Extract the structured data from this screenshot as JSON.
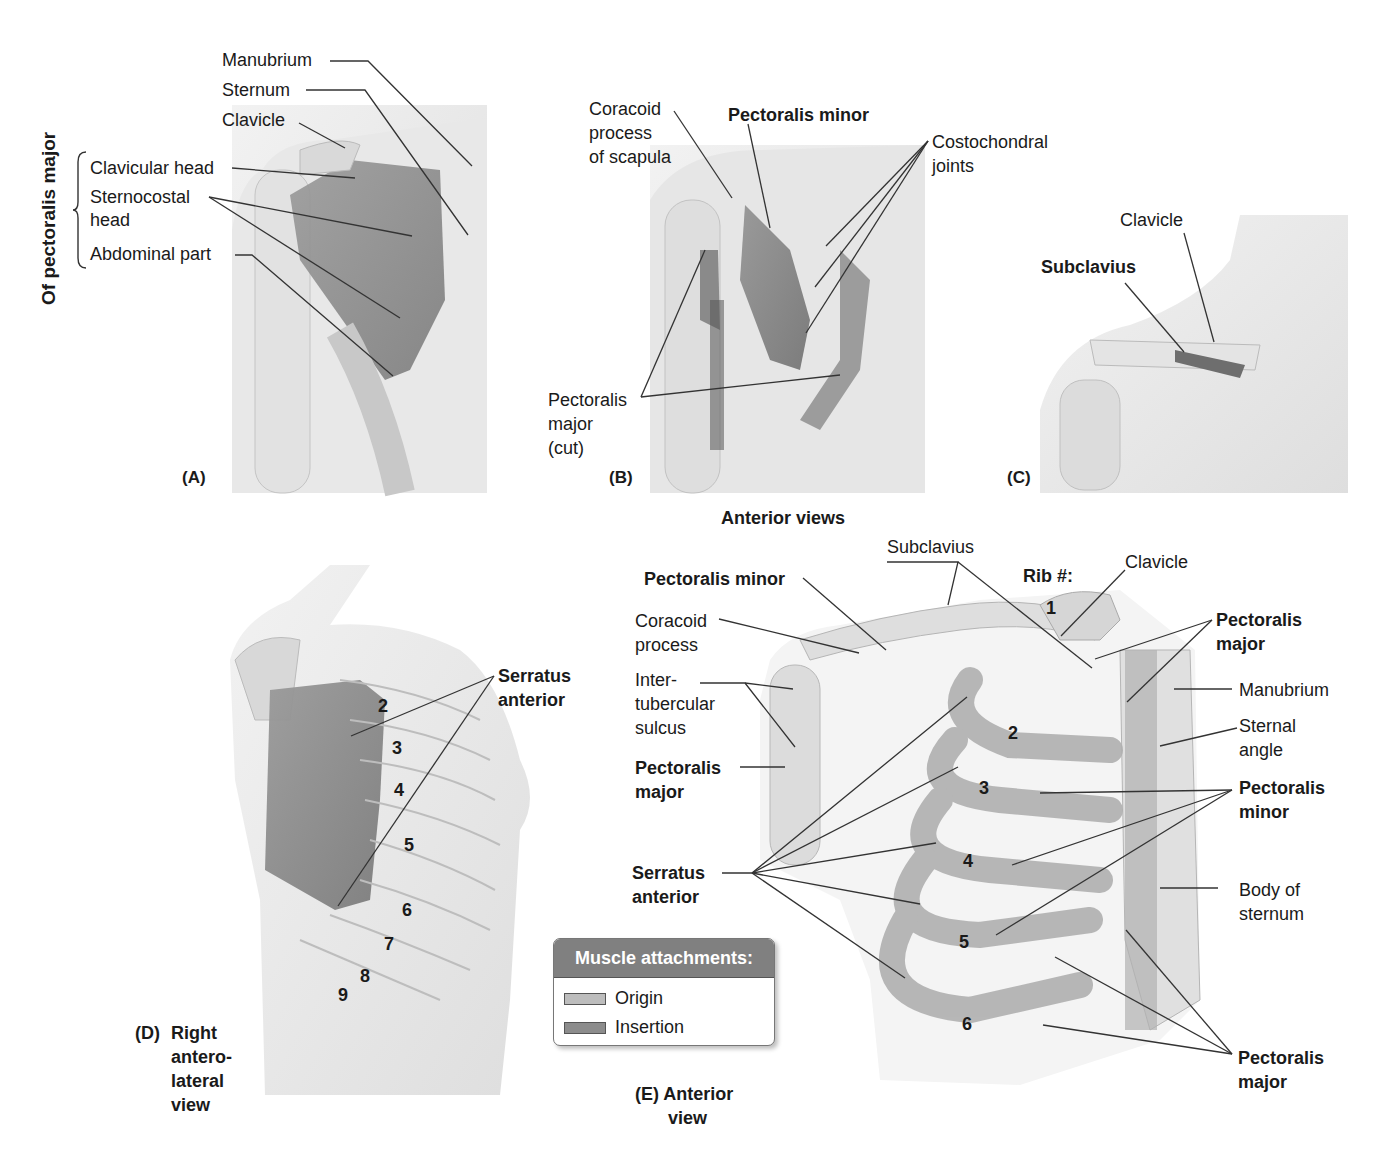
{
  "figure": {
    "side_title": "Of pectoralis major",
    "group_title": "Anterior views",
    "colors": {
      "skin": "#ececec",
      "bone": "#dcdcdc",
      "muscle": "#8a8a8a",
      "origin_swatch": "#bdbdbd",
      "insertion_swatch": "#8c8c8c",
      "legend_header": "#808080",
      "line": "#333333"
    }
  },
  "panels": {
    "A": {
      "tag": "(A)",
      "labels": [
        "Manubrium",
        "Sternum",
        "Clavicle",
        "Clavicular head",
        "Sternocostal",
        "head",
        "Abdominal part"
      ]
    },
    "B": {
      "tag": "(B)",
      "labels": {
        "coracoid": [
          "Coracoid",
          "process",
          "of scapula"
        ],
        "pec_minor": "Pectoralis minor",
        "costochondral": [
          "Costochondral",
          "joints"
        ],
        "pec_major_cut": [
          "Pectoralis",
          "major",
          "(cut)"
        ]
      }
    },
    "C": {
      "tag": "(C)",
      "labels": {
        "clavicle": "Clavicle",
        "subclavius": "Subclavius"
      }
    },
    "D": {
      "tag": "(D)",
      "caption": [
        "Right",
        "antero-",
        "lateral",
        "view"
      ],
      "serratus": [
        "Serratus",
        "anterior"
      ],
      "ribs": [
        "2",
        "3",
        "4",
        "5",
        "6",
        "7",
        "8",
        "9"
      ]
    },
    "E": {
      "caption": [
        "(E) Anterior",
        "view"
      ],
      "rib_heading": "Rib #:",
      "ribs": [
        "1",
        "2",
        "3",
        "4",
        "5",
        "6"
      ],
      "labels": {
        "subclavius": "Subclavius",
        "clavicle": "Clavicle",
        "pec_minor_top": "Pectoralis minor",
        "coracoid": [
          "Coracoid",
          "process"
        ],
        "intertubercular": [
          "Inter-",
          "tubercular",
          "sulcus"
        ],
        "pec_major_left": [
          "Pectoralis",
          "major"
        ],
        "serratus": [
          "Serratus",
          "anterior"
        ],
        "pec_major_top_right": [
          "Pectoralis",
          "major"
        ],
        "manubrium": "Manubrium",
        "sternal_angle": [
          "Sternal",
          "angle"
        ],
        "pec_minor_right": [
          "Pectoralis",
          "minor"
        ],
        "body_sternum": [
          "Body of",
          "sternum"
        ],
        "pec_major_bottom_right": [
          "Pectoralis",
          "major"
        ]
      }
    }
  },
  "legend": {
    "title": "Muscle attachments:",
    "items": [
      {
        "label": "Origin",
        "swatch": "origin"
      },
      {
        "label": "Insertion",
        "swatch": "insertion"
      }
    ]
  }
}
